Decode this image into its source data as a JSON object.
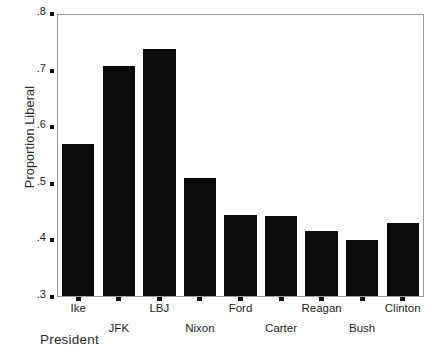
{
  "chart_data": {
    "type": "bar",
    "title": "",
    "xlabel": "President",
    "ylabel": "Proportion Liberal",
    "categories": [
      "Ike",
      "JFK",
      "LBJ",
      "Nixon",
      "Ford",
      "Carter",
      "Reagan",
      "Bush",
      "Clinton"
    ],
    "values": [
      0.57,
      0.71,
      0.74,
      0.51,
      0.445,
      0.442,
      0.415,
      0.4,
      0.43
    ],
    "ylim": [
      0.3,
      0.8
    ],
    "ytick_values": [
      0.3,
      0.4,
      0.5,
      0.6,
      0.7,
      0.8
    ],
    "ytick_labels": [
      ".3",
      ".4",
      ".5",
      ".6",
      ".7",
      ".8"
    ],
    "grid": false,
    "legend": null,
    "bar_color": "#0b0b0b",
    "frame_color": "#9a9a9a",
    "label_rows": [
      0,
      1,
      0,
      1,
      0,
      1,
      0,
      1,
      0
    ]
  }
}
